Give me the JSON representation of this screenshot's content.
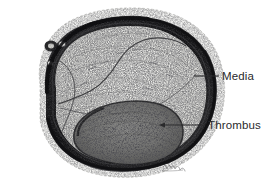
{
  "figure": {
    "kind": "anatomical-illustration",
    "medium": "stippled pen-and-ink drawing",
    "background_color": "#ffffff",
    "ink_color": "#2a2a2c",
    "signature": "artist signature"
  },
  "labels": [
    {
      "id": "media",
      "text": "Media",
      "leader": {
        "style": "plain-line",
        "from_x": 194,
        "from_y": 76,
        "to_x": 219,
        "to_y": 76
      }
    },
    {
      "id": "thrombus",
      "text": "Thrombus",
      "leader": {
        "style": "arrow-line",
        "from_x": 205,
        "from_y": 125,
        "to_x": 160,
        "to_y": 125
      }
    }
  ],
  "structures": {
    "adventitia": {
      "name": "Adventitia",
      "tone": "#efefef"
    },
    "media": {
      "name": "Media",
      "tone": "#1e1e20"
    },
    "intima": {
      "name": "Intima / fibrous plaque",
      "tone": "#e3e3e1"
    },
    "thrombus": {
      "name": "Thrombus",
      "tone": "#6d6d6d"
    }
  },
  "colors": {
    "ink": "#2a2a2c",
    "media_dark": "#1b1b1d",
    "thrombus_gray": "#70706e",
    "intima_light": "#e6e6e3",
    "adventitia_pale": "#f2f2f0",
    "page_white": "#ffffff"
  }
}
